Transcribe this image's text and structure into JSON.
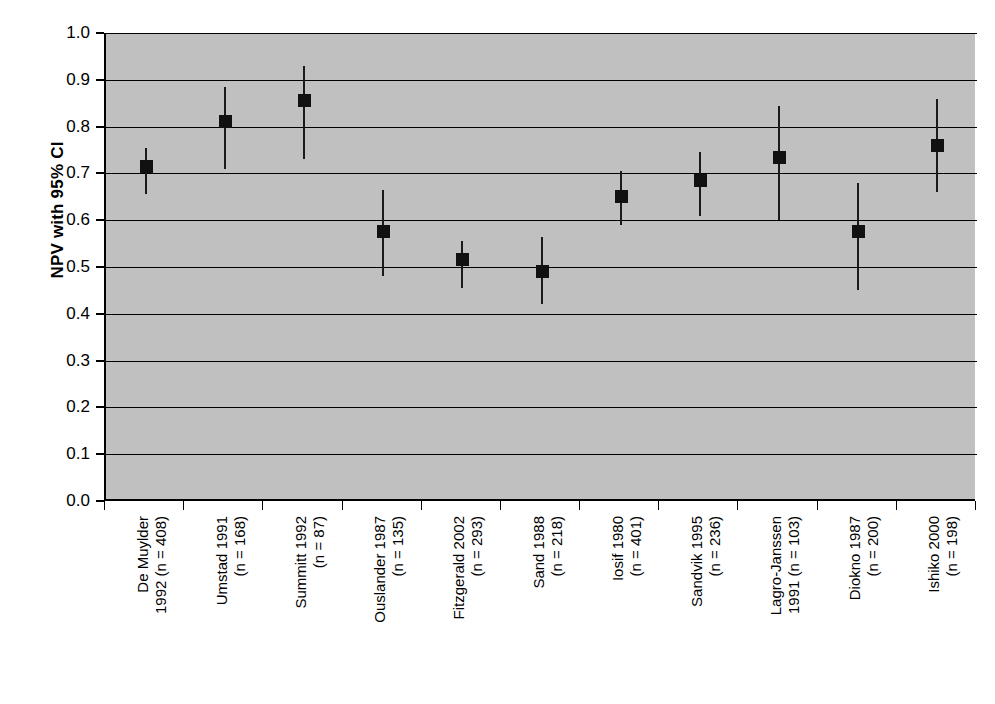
{
  "chart_data": {
    "type": "scatter",
    "title": "",
    "xlabel": "",
    "ylabel": "NPV with 95% CI",
    "ylim": [
      0.0,
      1.0
    ],
    "grid": true,
    "legend": "none",
    "ytick_labels": [
      "1.0",
      "0.9",
      "0.8",
      "0.7",
      "0.6",
      "0.5",
      "0.4",
      "0.3",
      "0.2",
      "0.1",
      "0.0"
    ],
    "ytick_values": [
      1.0,
      0.9,
      0.8,
      0.7,
      0.6,
      0.5,
      0.4,
      0.3,
      0.2,
      0.1,
      0.0
    ],
    "categories": [
      "De Muylder 1992 (n = 408)",
      "Umstad 1991 (n = 168)",
      "Summitt 1992 (n = 87)",
      "Ouslander 1987 (n = 135)",
      "Fitzgerald 2002 (n = 293)",
      "Sand 1988 (n = 218)",
      "Iosif 1980 (n = 401)",
      "Sandvik 1995 (n = 236)",
      "Lagro-Janssen 1991 (n = 103)",
      "Diokno 1987 (n = 200)",
      "Ishiko 2000 (n = 198)"
    ],
    "category_lines": [
      [
        "De Muylder",
        "1992 (n = 408)"
      ],
      [
        "Umstad 1991",
        "(n = 168)"
      ],
      [
        "Summitt 1992",
        "(n = 87)"
      ],
      [
        "Ouslander 1987",
        "(n = 135)"
      ],
      [
        "Fitzgerald 2002",
        "(n = 293)"
      ],
      [
        "Sand 1988",
        "(n = 218)"
      ],
      [
        "Iosif 1980",
        "(n = 401)"
      ],
      [
        "Sandvik 1995",
        "(n = 236)"
      ],
      [
        "Lagro-Janssen",
        "1991 (n = 103)"
      ],
      [
        "Diokno 1987",
        "(n = 200)"
      ],
      [
        "Ishiko 2000",
        "(n = 198)"
      ]
    ],
    "values": [
      0.715,
      0.81,
      0.855,
      0.575,
      0.515,
      0.49,
      0.65,
      0.685,
      0.735,
      0.575,
      0.76
    ],
    "ci_low": [
      0.655,
      0.71,
      0.73,
      0.48,
      0.455,
      0.42,
      0.59,
      0.61,
      0.6,
      0.45,
      0.66
    ],
    "ci_high": [
      0.755,
      0.885,
      0.93,
      0.665,
      0.555,
      0.565,
      0.705,
      0.745,
      0.845,
      0.68,
      0.86
    ],
    "marker": "filled-square",
    "marker_color": "#111111",
    "plot_background": "#c0c0c0",
    "sample_sizes": [
      408,
      168,
      87,
      135,
      293,
      218,
      401,
      236,
      103,
      200,
      198
    ],
    "study_names": [
      "De Muylder",
      "Umstad",
      "Summitt",
      "Ouslander",
      "Fitzgerald",
      "Sand",
      "Iosif",
      "Sandvik",
      "Lagro-Janssen",
      "Diokno",
      "Ishiko"
    ],
    "study_years": [
      1992,
      1991,
      1992,
      1987,
      2002,
      1988,
      1980,
      1995,
      1991,
      1987,
      2000
    ]
  }
}
